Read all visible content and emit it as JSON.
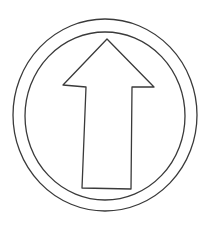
{
  "image": {
    "description": "Line drawing of an upward-pointing arrow inside a double circular ring (traffic sign style outline)",
    "colors": {
      "background": "#ffffff",
      "stroke": "#3a3a3a"
    }
  },
  "sign": {
    "label": "Ahead only sign outline",
    "outer_ring": {
      "cx": 105,
      "cy": 115,
      "rx": 92,
      "ry": 96
    },
    "inner_ring": {
      "cx": 105,
      "cy": 116,
      "rx": 80,
      "ry": 84
    },
    "arrow": {
      "direction": "up",
      "points": "107,39 154,87 132,87 131,189 82,188 86,87 63,85"
    }
  }
}
